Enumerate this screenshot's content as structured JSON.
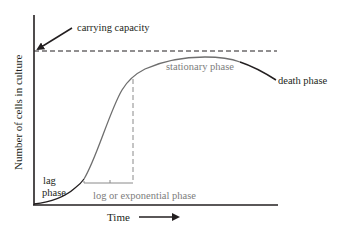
{
  "diagram": {
    "labels": {
      "carrying_capacity": "carrying capacity",
      "stationary_phase": "stationary phase",
      "death_phase": "death phase",
      "lag_line1": "lag",
      "lag_line2": "phase",
      "log_phase": "log or exponential phase",
      "x_axis": "Time",
      "y_axis": "Number of cells in culture"
    },
    "colors": {
      "axis": "#231f20",
      "curve_black": "#231f20",
      "curve_gray": "#6e6e6e",
      "gray_label": "#7d7d7d",
      "dashed": "#231f20",
      "dashed_gray": "#8a8a8a"
    },
    "phases": [
      "lag phase",
      "log or exponential phase",
      "stationary phase",
      "death phase"
    ]
  }
}
